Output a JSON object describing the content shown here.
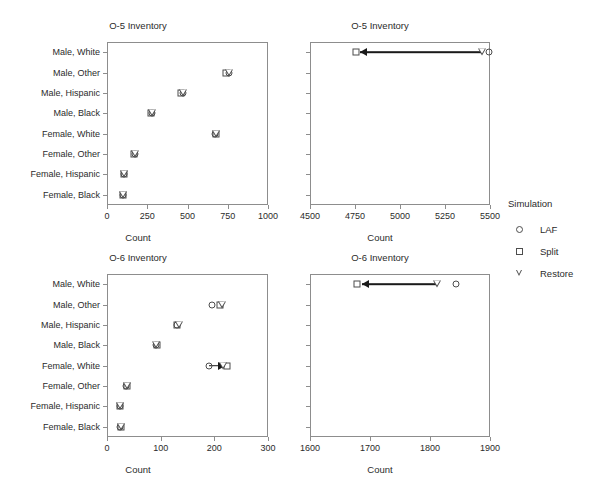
{
  "figure": {
    "supertitle": "",
    "legend": {
      "title": "Simulation",
      "entries": [
        {
          "label": "LAF",
          "symbol": "circle-open-icon"
        },
        {
          "label": "Split",
          "symbol": "square-open-icon"
        },
        {
          "label": "Restore",
          "symbol": "triangle-down-open-icon"
        }
      ]
    }
  },
  "chart_data": [
    {
      "id": "o5-lower",
      "type": "scatter",
      "title": "O-5 Inventory",
      "xlabel": "Count",
      "ylabel": "",
      "xlim": [
        0,
        1000
      ],
      "xticks": [
        0,
        250,
        500,
        750,
        1000
      ],
      "xtick_labels": [
        "0",
        "250",
        "500",
        "750",
        "1000"
      ],
      "categories": [
        "Male, White",
        "Male, Other",
        "Male, Hispanic",
        "Male, Black",
        "Female, White",
        "Female, Other",
        "Female, Hispanic",
        "Female, Black"
      ],
      "grid": false,
      "legend_position": "right",
      "series": [
        {
          "name": "LAF",
          "symbol": "circle-open-icon",
          "values": [
            null,
            760,
            475,
            278,
            672,
            172,
            108,
            100
          ]
        },
        {
          "name": "Split",
          "symbol": "square-open-icon",
          "values": [
            null,
            737,
            462,
            275,
            676,
            170,
            107,
            98
          ]
        },
        {
          "name": "Restore",
          "symbol": "triangle-down-open-icon",
          "values": [
            null,
            757,
            474,
            277,
            679,
            171,
            107,
            99
          ]
        }
      ],
      "notes": "Male, White values fall outside the 0-1000 range and are shown in the companion panel."
    },
    {
      "id": "o5-upper",
      "type": "scatter",
      "title": "O-5 Inventory",
      "xlabel": "Count",
      "ylabel": "",
      "xlim": [
        4500,
        5500
      ],
      "xticks": [
        4500,
        4750,
        5000,
        5250,
        5500
      ],
      "xtick_labels": [
        "4500",
        "4750",
        "5000",
        "5250",
        "5500"
      ],
      "categories": [
        "Male, White",
        "Male, Other",
        "Male, Hispanic",
        "Male, Black",
        "Female, White",
        "Female, Other",
        "Female, Hispanic",
        "Female, Black"
      ],
      "grid": false,
      "legend_position": "right",
      "series": [
        {
          "name": "LAF",
          "symbol": "circle-open-icon",
          "values": [
            5495,
            null,
            null,
            null,
            null,
            null,
            null,
            null
          ]
        },
        {
          "name": "Split",
          "symbol": "square-open-icon",
          "values": [
            4757,
            null,
            null,
            null,
            null,
            null,
            null,
            null
          ]
        },
        {
          "name": "Restore",
          "symbol": "triangle-down-open-icon",
          "values": [
            5455,
            null,
            null,
            null,
            null,
            null,
            null,
            null
          ]
        }
      ],
      "annotations": [
        {
          "type": "arrow",
          "row": "Male, White",
          "from": 5455,
          "to": 4775
        }
      ]
    },
    {
      "id": "o6-lower",
      "type": "scatter",
      "title": "O-6 Inventory",
      "xlabel": "Count",
      "ylabel": "",
      "xlim": [
        0,
        300
      ],
      "xticks": [
        0,
        100,
        200,
        300
      ],
      "xtick_labels": [
        "0",
        "100",
        "200",
        "300"
      ],
      "categories": [
        "Male, White",
        "Male, Other",
        "Male, Hispanic",
        "Male, Black",
        "Female, White",
        "Female, Other",
        "Female, Hispanic",
        "Female, Black"
      ],
      "grid": false,
      "legend_position": "right",
      "series": [
        {
          "name": "LAF",
          "symbol": "circle-open-icon",
          "values": [
            null,
            196,
            130,
            92,
            190,
            36,
            24,
            25
          ]
        },
        {
          "name": "Split",
          "symbol": "square-open-icon",
          "values": [
            null,
            211,
            131,
            93,
            224,
            38,
            25,
            27
          ]
        },
        {
          "name": "Restore",
          "symbol": "triangle-down-open-icon",
          "values": [
            null,
            214,
            135,
            92,
            217,
            37,
            24,
            26
          ]
        }
      ],
      "annotations": [
        {
          "type": "arrow",
          "row": "Female, White",
          "from": 190,
          "to": 220
        }
      ],
      "notes": "Male, White values fall outside the 0-300 range and are shown in the companion panel."
    },
    {
      "id": "o6-upper",
      "type": "scatter",
      "title": "O-6 Inventory",
      "xlabel": "Count",
      "ylabel": "",
      "xlim": [
        1600,
        1900
      ],
      "xticks": [
        1600,
        1700,
        1800,
        1900
      ],
      "xtick_labels": [
        "1600",
        "1700",
        "1800",
        "1900"
      ],
      "categories": [
        "Male, White",
        "Male, Other",
        "Male, Hispanic",
        "Male, Black",
        "Female, White",
        "Female, Other",
        "Female, Hispanic",
        "Female, Black"
      ],
      "grid": false,
      "legend_position": "right",
      "series": [
        {
          "name": "LAF",
          "symbol": "circle-open-icon",
          "values": [
            1843,
            null,
            null,
            null,
            null,
            null,
            null,
            null
          ]
        },
        {
          "name": "Split",
          "symbol": "square-open-icon",
          "values": [
            1678,
            null,
            null,
            null,
            null,
            null,
            null,
            null
          ]
        },
        {
          "name": "Restore",
          "symbol": "triangle-down-open-icon",
          "values": [
            1812,
            null,
            null,
            null,
            null,
            null,
            null,
            null
          ]
        }
      ],
      "annotations": [
        {
          "type": "arrow",
          "row": "Male, White",
          "from": 1812,
          "to": 1687
        }
      ]
    }
  ]
}
